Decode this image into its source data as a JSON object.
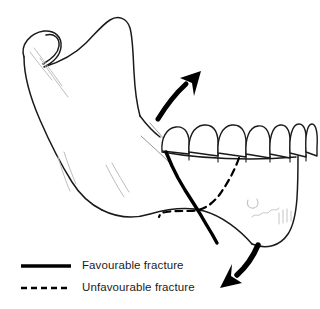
{
  "figure": {
    "labels": {
      "condyle": "condyle",
      "coronoid_process": "coronoid process",
      "sigmoid_notch": "sigmoid notch",
      "ramus": "ramus",
      "gonial_angle": "angle of mandible",
      "body": "body of mandible",
      "symphysis": "symphysis",
      "mental_foramen": "mental foramen",
      "tooth_row": "mandibular dentition"
    },
    "teeth_count": 9,
    "arrows": [
      {
        "name": "superior-muscle-pull-arrow",
        "direction": "up-right",
        "meaning": "proximal segment pulled superiorly by masseter and temporalis"
      },
      {
        "name": "inferior-muscle-pull-arrow",
        "direction": "down-left",
        "meaning": "distal segment pulled inferiorly by suprahyoid muscles"
      }
    ],
    "fractures": [
      {
        "name": "favourable-fracture-line",
        "style": "solid",
        "description": "line running antero-inferiorly from the molar alveolar crest to the inferior border"
      },
      {
        "name": "unfavourable-fracture-line",
        "style": "dashed",
        "description": "line running postero-inferiorly from the premolar alveolar crest to the inferior border"
      }
    ]
  },
  "legend": {
    "items": [
      {
        "label": "Favourable fracture",
        "style": "solid",
        "color": "#000000"
      },
      {
        "label": "Unfavourable fracture",
        "style": "dashed",
        "color": "#000000"
      }
    ]
  },
  "colors": {
    "outline": "#1a1a1a",
    "shading": "#b9b9b9",
    "fracture": "#000000",
    "arrow": "#000000",
    "background": "#ffffff",
    "text": "#1c1c1c"
  }
}
